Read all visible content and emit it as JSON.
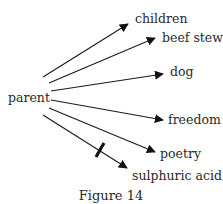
{
  "diagram": {
    "source": {
      "label": "parent"
    },
    "targets": [
      {
        "label": "children",
        "blocked": false
      },
      {
        "label": "beef stew",
        "blocked": false
      },
      {
        "label": "dog",
        "blocked": false
      },
      {
        "label": "freedom",
        "blocked": false
      },
      {
        "label": "poetry",
        "blocked": false
      },
      {
        "label": "sulphuric acid",
        "blocked": true
      }
    ],
    "caption": "Figure 14"
  }
}
